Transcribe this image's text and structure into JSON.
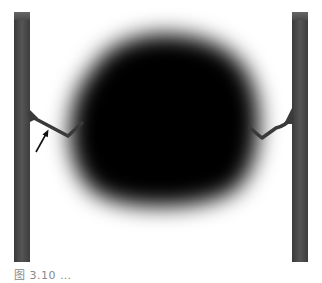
{
  "figure": {
    "colors": {
      "background": "#ffffff",
      "pillar": "#444444",
      "pillar_highlight": "#5a5a5a",
      "blob": "#050505",
      "arm": "#3a3a3a",
      "arrow": "#111111"
    },
    "annotations": [
      {
        "type": "arrow",
        "points_to": "left-arm-bend",
        "label": ""
      }
    ]
  },
  "caption": {
    "text": "图 3.10 …",
    "clipped": true
  }
}
